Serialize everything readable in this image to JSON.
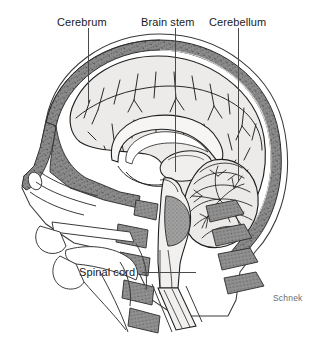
{
  "figure": {
    "view": "midsagittal / median section, left lateral profile facing left",
    "background_color": "#ffffff",
    "ink_color": "#1a1a1a",
    "skull_fill": "#8b8b8b",
    "brain_fill": "#edebe9",
    "vertebra_fill": "#8e8e8e",
    "leader_color": "#4a4a4a",
    "signature_color": "#6d6d6d"
  },
  "labels": {
    "cerebrum": {
      "text": "Cerebrum",
      "leader": {
        "type": "vertical",
        "x": 88,
        "y_top": 28,
        "y_bottom": 106
      }
    },
    "brain_stem": {
      "text": "Brain stem",
      "leader": {
        "type": "vertical",
        "x": 175,
        "y_top": 28,
        "y_bottom": 172
      }
    },
    "cerebellum": {
      "text": "Cerebellum",
      "leader": {
        "type": "vertical",
        "x": 238,
        "y_top": 28,
        "y_bottom": 182
      }
    },
    "spinal_cord": {
      "text": "Spinal cord",
      "leader": {
        "type": "horizontal",
        "y": 272,
        "x_left": 142,
        "x_right": 196
      }
    }
  },
  "signature": {
    "text": "Schnek"
  },
  "structures": [
    {
      "name": "scalp-outline",
      "description": "outer skin contour of head, face and neck"
    },
    {
      "name": "cranium-bone",
      "description": "gray stippled skull vault band"
    },
    {
      "name": "cerebrum",
      "description": "large convoluted cerebral hemisphere with sulci and gyri"
    },
    {
      "name": "corpus-callosum",
      "description": "arched white-matter band in center of cerebrum"
    },
    {
      "name": "lateral-ventricle",
      "description": "crescent cavity beneath corpus callosum"
    },
    {
      "name": "thalamus",
      "description": "oval mass at center of brain"
    },
    {
      "name": "cerebellum",
      "description": "posterior-inferior lobed mass with arbor vitae branching"
    },
    {
      "name": "brain-stem",
      "description": "midbrain, pons and medulla column descending to foramen magnum"
    },
    {
      "name": "spinal-cord",
      "description": "cord continuing from medulla down the vertebral canal"
    },
    {
      "name": "cervical-vertebrae",
      "description": "stacked gray vertebral bodies and spinous processes"
    },
    {
      "name": "nasal-cavity",
      "description": "anterior air space behind the nose"
    },
    {
      "name": "hard-palate",
      "description": "bony shelf forming roof of mouth"
    },
    {
      "name": "tongue",
      "description": "oral soft tissue"
    },
    {
      "name": "pharynx",
      "description": "airway behind tongue"
    },
    {
      "name": "frontal-sinus",
      "description": "small cavity above the nasal bridge"
    }
  ]
}
